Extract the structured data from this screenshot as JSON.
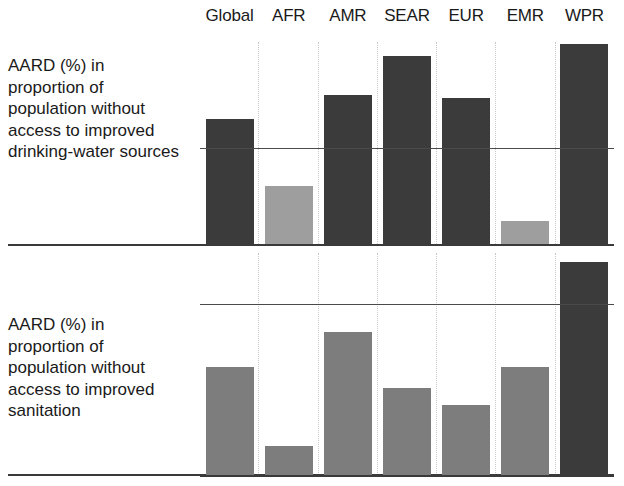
{
  "chart_data": {
    "type": "bar",
    "title": "",
    "subtitle": "",
    "xlabel": "",
    "ylabel": "AARD (%)",
    "grid": "vertical dotted separators between categories; horizontal reference line per panel",
    "legend": "none",
    "categories": [
      "Global",
      "AFR",
      "AMR",
      "SEAR",
      "EUR",
      "EMR",
      "WPR"
    ],
    "panels": [
      {
        "name": "drinking-water",
        "ylabel": "AARD (%) in proportion of population without access to improved drinking-water sources",
        "reference_line": 1.0,
        "ylim": [
          0,
          2.1
        ],
        "values": [
          1.3,
          0.6,
          1.55,
          1.95,
          1.52,
          0.24,
          2.08
        ],
        "bar_shades": [
          "dark",
          "light",
          "dark",
          "dark",
          "dark",
          "light",
          "dark"
        ]
      },
      {
        "name": "sanitation",
        "ylabel": "AARD (%) in proportion of population without access to improved sanitation",
        "reference_line": 1.0,
        "ylim": [
          0,
          1.3
        ],
        "values": [
          0.63,
          0.17,
          0.84,
          0.51,
          0.41,
          0.63,
          1.25
        ],
        "bar_shades": [
          "mid",
          "mid",
          "mid",
          "mid",
          "mid",
          "mid",
          "dark"
        ]
      }
    ],
    "colors": {
      "bar_dark": "#3b3b3b",
      "bar_mid": "#7d7d7d",
      "bar_light": "#9e9e9e",
      "axis": "#3a3a3a",
      "gridline": "#c9c9c9",
      "reference_line": "#4a4a4a",
      "text": "#1a1a1a",
      "background": "#ffffff"
    }
  },
  "columns": [
    {
      "label": "Global"
    },
    {
      "label": "AFR"
    },
    {
      "label": "AMR"
    },
    {
      "label": "SEAR"
    },
    {
      "label": "EUR"
    },
    {
      "label": "EMR"
    },
    {
      "label": "WPR"
    }
  ],
  "panels": {
    "water": {
      "label": "AARD (%) in proportion of population without access to improved drinking-water sources"
    },
    "sanitation": {
      "label": "AARD (%) in proportion of population without access to improved sanitation"
    }
  }
}
